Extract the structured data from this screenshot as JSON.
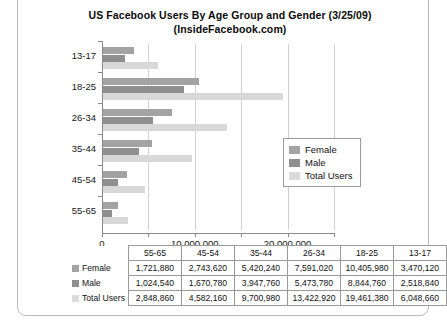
{
  "chart_data": {
    "type": "bar",
    "orientation": "horizontal",
    "title": "US Facebook Users By Age Group and Gender (3/25/09)",
    "subtitle": "(InsideFacebook.com)",
    "xlabel": "",
    "ylabel": "",
    "categories": [
      "13-17",
      "18-25",
      "26-34",
      "35-44",
      "45-54",
      "55-65"
    ],
    "series": [
      {
        "name": "Female",
        "color": "#a3a3a3",
        "values": [
          3470120,
          10405980,
          7591020,
          5420240,
          2743620,
          1721880
        ]
      },
      {
        "name": "Male",
        "color": "#8f8f8f",
        "values": [
          2518840,
          8844760,
          5473780,
          3947760,
          1670780,
          1024540
        ]
      },
      {
        "name": "Total Users",
        "color": "#d8d8d8",
        "values": [
          6048660,
          19461380,
          13422920,
          9700980,
          4582160,
          2848860
        ]
      }
    ],
    "xlim": [
      0,
      25000000
    ],
    "xticks": [
      0,
      5000000,
      10000000,
      15000000,
      20000000,
      25000000
    ],
    "xtick_labels": [
      "0",
      "",
      "10,000,000",
      "",
      "20,000,000",
      ""
    ],
    "grid": true,
    "legend_position": "center-right"
  },
  "legend": {
    "items": [
      {
        "label": "Female",
        "swatch_class": "female"
      },
      {
        "label": "Male",
        "swatch_class": "male"
      },
      {
        "label": "Total Users",
        "swatch_class": "total"
      }
    ]
  },
  "table": {
    "corner": "",
    "columns": [
      "55-65",
      "45-54",
      "35-44",
      "26-34",
      "18-25",
      "13-17"
    ],
    "rows": [
      {
        "label": "Female",
        "swatch_class": "female",
        "values": [
          "1,721,880",
          "2,743,620",
          "5,420,240",
          "7,591,020",
          "10,405,980",
          "3,470,120"
        ]
      },
      {
        "label": "Male",
        "swatch_class": "male",
        "values": [
          "1,024,540",
          "1,670,780",
          "3,947,760",
          "5,473,780",
          "8,844,760",
          "2,518,840"
        ]
      },
      {
        "label": "Total Users",
        "swatch_class": "total",
        "values": [
          "2,848,860",
          "4,582,160",
          "9,700,980",
          "13,422,920",
          "19,461,380",
          "6,048,660"
        ]
      }
    ]
  },
  "colors": {
    "female": "#a3a3a3",
    "male": "#8f8f8f",
    "total": "#d8d8d8",
    "axis": "#8a8a8a",
    "grid": "#d2d2d2",
    "text": "#111111"
  }
}
